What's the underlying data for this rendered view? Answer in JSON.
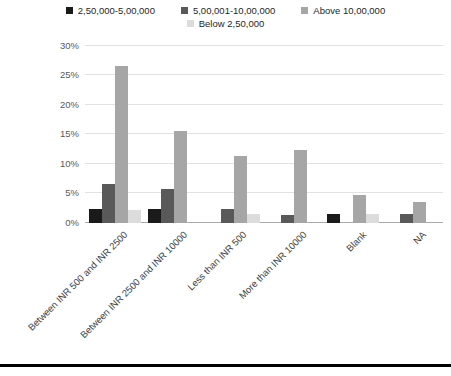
{
  "chart_data": {
    "type": "bar",
    "title": "",
    "xlabel": "",
    "ylabel": "",
    "categories": [
      "Between INR 500 and INR 2500",
      "Between INR 2500 and INR 10000",
      "Less than INR 500",
      "More than INR 10000",
      "Blank",
      "NA"
    ],
    "series": [
      {
        "name": "2,50,000-5,00,000",
        "color": "#1a1a1a",
        "values": [
          2.3,
          2.3,
          0,
          0,
          1.4,
          0
        ]
      },
      {
        "name": "5,00,001-10,00,000",
        "color": "#595959",
        "values": [
          6.5,
          5.6,
          2.3,
          1.3,
          0,
          1.4
        ]
      },
      {
        "name": "Above 10,00,000",
        "color": "#a6a6a6",
        "values": [
          26.5,
          15.5,
          11.3,
          12.3,
          4.6,
          3.5
        ]
      },
      {
        "name": "Below 2,50,000",
        "color": "#dcdcdc",
        "values": [
          2.2,
          0,
          1.4,
          0,
          1.4,
          0
        ]
      }
    ],
    "ylim": [
      0,
      30
    ],
    "ytick_step": 5,
    "ytick_labels": [
      "0%",
      "5%",
      "10%",
      "15%",
      "20%",
      "25%",
      "30%"
    ],
    "grid": true,
    "legend_position": "top",
    "legend_rows": [
      [
        "2,50,000-5,00,000",
        "5,00,001-10,00,000",
        "Above 10,00,000"
      ],
      [
        "Below 2,50,000"
      ]
    ]
  },
  "colors": {
    "gridline": "#e2e2e2",
    "baseline": "#ababab",
    "bottom_rule": "#000000",
    "background": "#ffffff"
  },
  "layout_text": {
    "note": ""
  }
}
